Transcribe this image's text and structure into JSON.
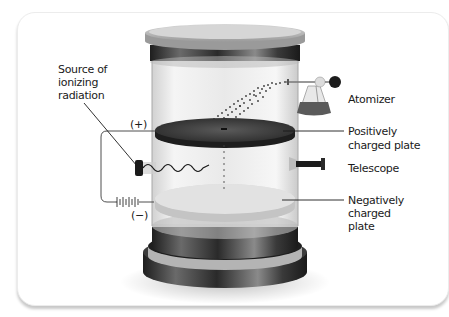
{
  "diagram": {
    "labels": {
      "source": [
        "Source of",
        "ionizing",
        "radiation"
      ],
      "plus": "(+)",
      "minus": "(−)",
      "atomizer": "Atomizer",
      "positive_plate": [
        "Positively",
        "charged plate"
      ],
      "telescope": "Telescope",
      "negative_plate": [
        "Negatively",
        "charged",
        "plate"
      ]
    },
    "components": [
      "glass-cylinder",
      "lid",
      "atomizer",
      "oil-droplets",
      "positive-plate",
      "negative-plate",
      "telescope",
      "radiation-source",
      "battery",
      "base"
    ],
    "colors": {
      "background": "#ffffff",
      "text": "#1a1a1a",
      "dark_metal": "#2b2b2b",
      "glass": "#e4e4e4"
    }
  }
}
